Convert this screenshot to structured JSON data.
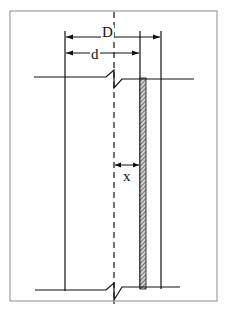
{
  "diagram": {
    "labels": {
      "outer_diameter": "D",
      "inner_diameter": "d",
      "offset": "x"
    },
    "colors": {
      "line": "#111111",
      "frame": "#8a8a8a",
      "hatch": "#555555",
      "background": "#ffffff"
    }
  }
}
